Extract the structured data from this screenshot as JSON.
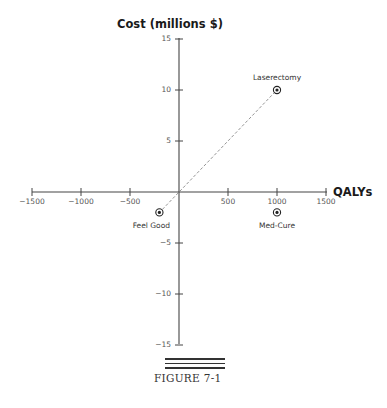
{
  "chart_data": {
    "type": "scatter",
    "title": "",
    "xlabel": "QALYs",
    "ylabel": "Cost (millions $)",
    "xlim": [
      -1500,
      1500
    ],
    "ylim": [
      -15,
      15
    ],
    "x_ticks": [
      -1500,
      -1000,
      -500,
      500,
      1000,
      1500
    ],
    "y_ticks": [
      15,
      10,
      5,
      -5,
      -10,
      -15
    ],
    "x_tick_labels": [
      "−1500",
      "−1000",
      "−500",
      "500",
      "1000",
      "1500"
    ],
    "y_tick_labels": [
      "15",
      "10",
      "5",
      "−5",
      "−10",
      "−15"
    ],
    "grid": false,
    "points": [
      {
        "label": "Laserectomy",
        "x": 1000,
        "y": 10
      },
      {
        "label": "Feel Good",
        "x": -200,
        "y": -2
      },
      {
        "label": "Med-Cure",
        "x": 1000,
        "y": -2
      }
    ],
    "annotations": [
      {
        "type": "dashed-line",
        "from": [
          -200,
          -2
        ],
        "to": [
          1000,
          10
        ]
      }
    ]
  },
  "caption": "FIGURE 7-1"
}
